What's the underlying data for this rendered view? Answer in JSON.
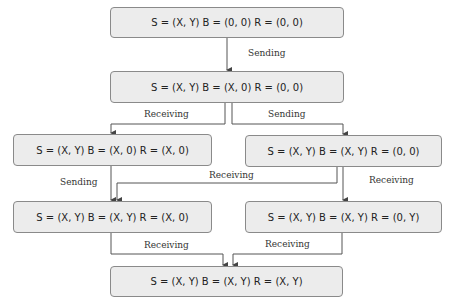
{
  "diagram": {
    "type": "state-transition-flowchart",
    "nodes": [
      {
        "id": "n1",
        "label": "S = (X, Y) B = (0, 0) R = (0, 0)"
      },
      {
        "id": "n2",
        "label": "S = (X, Y) B = (X, 0) R = (0, 0)"
      },
      {
        "id": "n3",
        "label": "S = (X, Y) B = (X, 0) R = (X, 0)"
      },
      {
        "id": "n4",
        "label": "S = (X, Y) B = (X, Y) R = (0, 0)"
      },
      {
        "id": "n5",
        "label": "S = (X, Y) B = (X, Y) R = (X, 0)"
      },
      {
        "id": "n6",
        "label": "S = (X, Y) B = (X, Y) R = (0, Y)"
      },
      {
        "id": "n7",
        "label": "S = (X, Y) B = (X, Y) R = (X, Y)"
      }
    ],
    "edges": [
      {
        "from": "n1",
        "to": "n2",
        "label": "Sending"
      },
      {
        "from": "n2",
        "to": "n3",
        "label": "Receiving"
      },
      {
        "from": "n2",
        "to": "n4",
        "label": "Sending"
      },
      {
        "from": "n3",
        "to": "n5",
        "label": "Sending"
      },
      {
        "from": "n4",
        "to": "n5",
        "label": "Receiving"
      },
      {
        "from": "n4",
        "to": "n6",
        "label": "Receiving"
      },
      {
        "from": "n5",
        "to": "n7",
        "label": "Receiving"
      },
      {
        "from": "n6",
        "to": "n7",
        "label": "Receiving"
      }
    ]
  },
  "colors": {
    "box_fill": "#ececec",
    "box_border": "#8a8a8a",
    "line": "#555555"
  }
}
